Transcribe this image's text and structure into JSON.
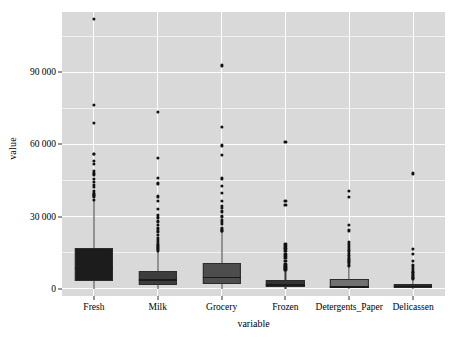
{
  "chart_data": {
    "type": "boxplot",
    "title": "",
    "xlabel": "variable",
    "ylabel": "value",
    "categories": [
      "Fresh",
      "Milk",
      "Grocery",
      "Frozen",
      "Detergents_Paper",
      "Delicassen"
    ],
    "ylim": [
      -3000,
      115000
    ],
    "y_ticks": [
      0,
      30000,
      60000,
      90000
    ],
    "y_tick_labels": [
      "0",
      "30 000",
      "60 000",
      "90 000"
    ],
    "y_minor_ticks": [
      15000,
      45000,
      75000,
      105000
    ],
    "grid": "white major and minor horizontal gridlines, white major vertical gridlines on panel",
    "legend": "none",
    "panel_background": "#d9d9d9",
    "series": [
      {
        "name": "Fresh",
        "fill": "#1c1c1c",
        "q1": 3128,
        "median": 8504,
        "q3": 16934,
        "whisker_low": 3,
        "whisker_high": 36847,
        "outliers": [
          112151,
          76237,
          68951,
          56159,
          56083,
          53205,
          51909,
          49063,
          48228,
          47493,
          45640,
          44466,
          43265,
          42312,
          40721,
          39679,
          39228,
          38793,
          38228,
          37036
        ]
      },
      {
        "name": "Milk",
        "fill": "#3d3d3d",
        "q1": 1533,
        "median": 3627,
        "q3": 7190,
        "whisker_low": 55,
        "whisker_high": 15488,
        "outliers": [
          73498,
          54259,
          46197,
          43950,
          43687,
          38369,
          36423,
          33267,
          30810,
          29627,
          28326,
          27626,
          26373,
          25071,
          24025,
          23527,
          22222,
          21217,
          20170,
          19310,
          18664,
          18291,
          17866,
          17360,
          16966,
          16448,
          15923
        ]
      },
      {
        "name": "Grocery",
        "fill": "#4d4d4d",
        "q1": 2153,
        "median": 4756,
        "q3": 10656,
        "whisker_low": 3,
        "whisker_high": 23527,
        "outliers": [
          92780,
          67298,
          59598,
          55571,
          45828,
          42609,
          39694,
          36486,
          34454,
          33731,
          32114,
          30243,
          29892,
          28540,
          27864,
          26839,
          25071,
          24231,
          23998
        ]
      },
      {
        "name": "Frozen",
        "fill": "#343434",
        "q1": 742,
        "median": 1526,
        "q3": 3554,
        "whisker_low": 25,
        "whisker_high": 7782,
        "outliers": [
          60869,
          36534,
          35009,
          18711,
          17866,
          16801,
          15601,
          14472,
          13644,
          12689,
          11559,
          10155,
          9464,
          8929,
          8557,
          8308,
          7986
        ]
      },
      {
        "name": "Detergents_Paper",
        "fill": "#717171",
        "q1": 256,
        "median": 817,
        "q3": 3922,
        "whisker_low": 3,
        "whisker_high": 9412,
        "outliers": [
          40827,
          38102,
          26701,
          24231,
          19410,
          18594,
          17740,
          16966,
          16128,
          15601,
          14841,
          14076,
          13507,
          12798,
          12206,
          11589,
          11093,
          10614,
          10069,
          9592
        ]
      },
      {
        "name": "Delicassen",
        "fill": "#2a2a2a",
        "q1": 408,
        "median": 966,
        "q3": 1820,
        "whisker_low": 3,
        "whisker_high": 3977,
        "outliers": [
          47943,
          16523,
          14351,
          11559,
          9746,
          8550,
          7844,
          7173,
          6854,
          6372,
          5609,
          5185,
          4843,
          4608,
          4371,
          4144
        ]
      }
    ]
  },
  "axes": {
    "y_title": "value",
    "x_title": "variable"
  },
  "footer": {
    "caption": ""
  }
}
